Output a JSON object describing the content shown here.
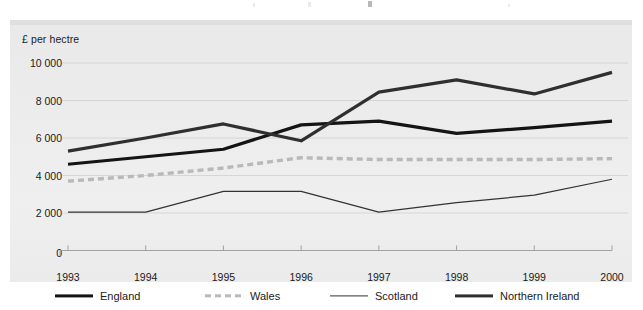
{
  "chart_data": {
    "type": "line",
    "title": "",
    "subtitle": "",
    "xlabel": "",
    "ylabel": "£ per hectre",
    "categories": [
      "1993",
      "1994",
      "1995",
      "1996",
      "1997",
      "1998",
      "1999",
      "2000"
    ],
    "x": [
      1993,
      1994,
      1995,
      1996,
      1997,
      1998,
      1999,
      2000
    ],
    "ylim": [
      0,
      10600
    ],
    "xlim": [
      1993,
      2000
    ],
    "yticks": [
      0,
      2000,
      4000,
      6000,
      8000,
      10000
    ],
    "ytick_labels": [
      "0",
      "2 000",
      "4 000",
      "6 000",
      "8 000",
      "10 000"
    ],
    "grid": "horizontal",
    "legend_position": "bottom",
    "series": [
      {
        "name": "England",
        "values": [
          4600,
          5000,
          5400,
          6700,
          6900,
          6250,
          6550,
          6900
        ],
        "color": "#141414",
        "style": "solid",
        "width": 3.2
      },
      {
        "name": "Wales",
        "values": [
          3700,
          4000,
          4400,
          4950,
          4850,
          4850,
          4850,
          4900
        ],
        "color": "#b9b9b9",
        "style": "dashed",
        "width": 3.4
      },
      {
        "name": "Scotland",
        "values": [
          2050,
          2050,
          3150,
          3150,
          2050,
          2550,
          2950,
          3800
        ],
        "color": "#333333",
        "style": "solid",
        "width": 1.2
      },
      {
        "name": "Northern Ireland",
        "values": [
          5300,
          6000,
          6750,
          5850,
          8450,
          9100,
          8350,
          9500
        ],
        "color": "#2f2f2f",
        "style": "solid",
        "width": 3.2
      }
    ]
  },
  "axes": {
    "y_title": "£ per hectre",
    "y_tick_labels": [
      "10 000",
      "8 000",
      "6 000",
      "4 000",
      "2 000",
      "0"
    ],
    "x_tick_labels": [
      "1993",
      "1994",
      "1995",
      "1996",
      "1997",
      "1998",
      "1999",
      "2000"
    ]
  },
  "legend": {
    "items": [
      {
        "label": "England",
        "swatch": "solid-thick-black-line-icon"
      },
      {
        "label": "Wales",
        "swatch": "dashed-gray-line-icon"
      },
      {
        "label": "Scotland",
        "swatch": "solid-thin-black-line-icon"
      },
      {
        "label": "Northern Ireland",
        "swatch": "solid-thick-darkgray-line-icon"
      }
    ]
  },
  "colors": {
    "panel_background": "#ececec",
    "page_background": "#ffffff",
    "gridline": "#cfcfcf",
    "axis_line": "#9a9a9a",
    "text": "#1a1a1a",
    "england": "#141414",
    "wales": "#b9b9b9",
    "scotland": "#333333",
    "northern_ireland": "#2f2f2f"
  }
}
